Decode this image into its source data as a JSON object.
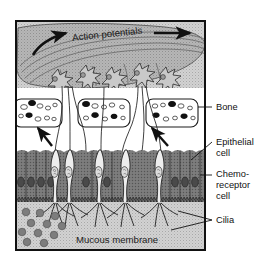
{
  "figure": {
    "title_in_image": "Action potentials",
    "bottom_caption": "Mucous membrane",
    "frame": {
      "x": 16,
      "y": 21,
      "width": 189,
      "height": 229,
      "border_color": "#111111"
    },
    "colors": {
      "background_stipple": "#cfcfcf",
      "nerve_bundle": "#b3b3b3",
      "bone_cavity_fill": "#ffffff",
      "epithelium_dark": "#6d6d6d",
      "receptor_cell_light": "#e8e8e8",
      "mucus_granule": "#7a7a7a",
      "mucous_layer": "#c6c6c6",
      "outline": "#1a1a1a",
      "label_text": "#111111"
    }
  },
  "labels": [
    {
      "id": "bone",
      "text": "Bone",
      "x": 216,
      "y": 110,
      "leader": {
        "x1": 198,
        "y1": 107,
        "x2": 212,
        "y2": 107
      }
    },
    {
      "id": "epithelial-cell",
      "text": "Epithelial",
      "text2": "cell",
      "x": 216,
      "y": 145,
      "leader": {
        "x1": 191,
        "y1": 160,
        "x2": 212,
        "y2": 142
      }
    },
    {
      "id": "chemoreceptor-cell",
      "text": "Chemo-",
      "text2": "receptor",
      "text3": "cell",
      "x": 216,
      "y": 177,
      "leader": {
        "x1": 200,
        "y1": 175,
        "x2": 212,
        "y2": 175
      }
    },
    {
      "id": "cilia",
      "text": "Cilia",
      "x": 216,
      "y": 222,
      "leader": {
        "x1": 178,
        "y1": 212,
        "x2": 212,
        "y2": 220
      },
      "leader2": {
        "x1": 172,
        "y1": 229,
        "x2": 212,
        "y2": 220
      }
    }
  ],
  "annotations": {
    "action_potential_arrow_left": "curved-arrow-right",
    "action_potential_arrow_right": "straight-arrow-right",
    "signal_arrow_1": "diagonal-arrow-up-left",
    "signal_arrow_2": "diagonal-arrow-up-left"
  },
  "structures": {
    "nerve_bundle_label": "olfactory-nerve-bundle",
    "neuron_count": 5,
    "bone_cavity_count": 3,
    "receptor_cell_count": 5,
    "mucus_granule_count": 11
  }
}
